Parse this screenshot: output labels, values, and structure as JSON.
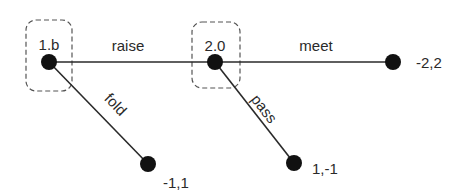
{
  "diagram": {
    "type": "game-tree",
    "nodes": [
      {
        "id": "n1",
        "label": "1.b",
        "role": "decision",
        "player": 1
      },
      {
        "id": "n2",
        "label": "2.0",
        "role": "decision",
        "player": 2
      },
      {
        "id": "t_fold",
        "label": "-1,1",
        "role": "terminal"
      },
      {
        "id": "t_meet",
        "label": "-2,2",
        "role": "terminal"
      },
      {
        "id": "t_pass",
        "label": "1,-1",
        "role": "terminal"
      }
    ],
    "edges": [
      {
        "from": "n1",
        "to": "n2",
        "label": "raise"
      },
      {
        "from": "n1",
        "to": "t_fold",
        "label": "fold"
      },
      {
        "from": "n2",
        "to": "t_meet",
        "label": "meet"
      },
      {
        "from": "n2",
        "to": "t_pass",
        "label": "pass"
      }
    ],
    "colors": {
      "line": "#2a2a2a",
      "node": "#111111",
      "infoset_border": "#555555",
      "background": "#ffffff"
    }
  }
}
